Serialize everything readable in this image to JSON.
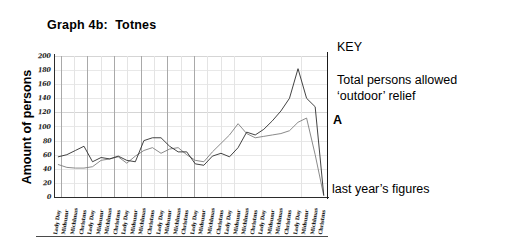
{
  "title": "Graph 4b:  Totnes",
  "axis": {
    "ylabel": "Amount of persons",
    "yticks": [
      "200",
      "180",
      "160",
      "140",
      "120",
      "100",
      "80",
      "60",
      "40",
      "20",
      "0"
    ]
  },
  "key": {
    "heading": "KEY",
    "series_label_line1": "Total persons allowed",
    "series_label_line2": "‘outdoor’ relief",
    "pointer_label": "A",
    "second_series_label": "last year’s figures"
  },
  "chart_data": {
    "type": "line",
    "title": "Graph 4b:  Totnes",
    "xlabel": "",
    "ylabel": "Amount of persons",
    "ylim": [
      0,
      200
    ],
    "grid": true,
    "legend_position": "right",
    "note": "Hand-drawn photocopied chart; x tick labels are handwritten rotated date entries, individually illegible at source resolution.",
    "categories": [
      "x1",
      "x2",
      "x3",
      "x4",
      "x5",
      "x6",
      "x7",
      "x8",
      "x9",
      "x10",
      "x11",
      "x12",
      "x13",
      "x14",
      "x15",
      "x16",
      "x17",
      "x18",
      "x19",
      "x20",
      "x21",
      "x22",
      "x23",
      "x24",
      "x25",
      "x26",
      "x27",
      "x28",
      "x29",
      "x30",
      "x31",
      "x32"
    ],
    "series": [
      {
        "name": "Total persons allowed ‘outdoor’ relief",
        "color": "#2e2e2e",
        "values": [
          57,
          60,
          66,
          72,
          50,
          56,
          54,
          58,
          52,
          50,
          80,
          84,
          84,
          72,
          64,
          64,
          47,
          45,
          58,
          62,
          57,
          70,
          92,
          88,
          96,
          108,
          122,
          140,
          182,
          140,
          128,
          3
        ]
      },
      {
        "name": "last year’s figures",
        "color": "#7d7d7d",
        "values": [
          46,
          42,
          41,
          41,
          43,
          52,
          54,
          57,
          48,
          58,
          66,
          70,
          62,
          68,
          70,
          60,
          52,
          50,
          64,
          76,
          88,
          104,
          90,
          84,
          86,
          88,
          90,
          94,
          106,
          112,
          60,
          2
        ]
      }
    ]
  }
}
